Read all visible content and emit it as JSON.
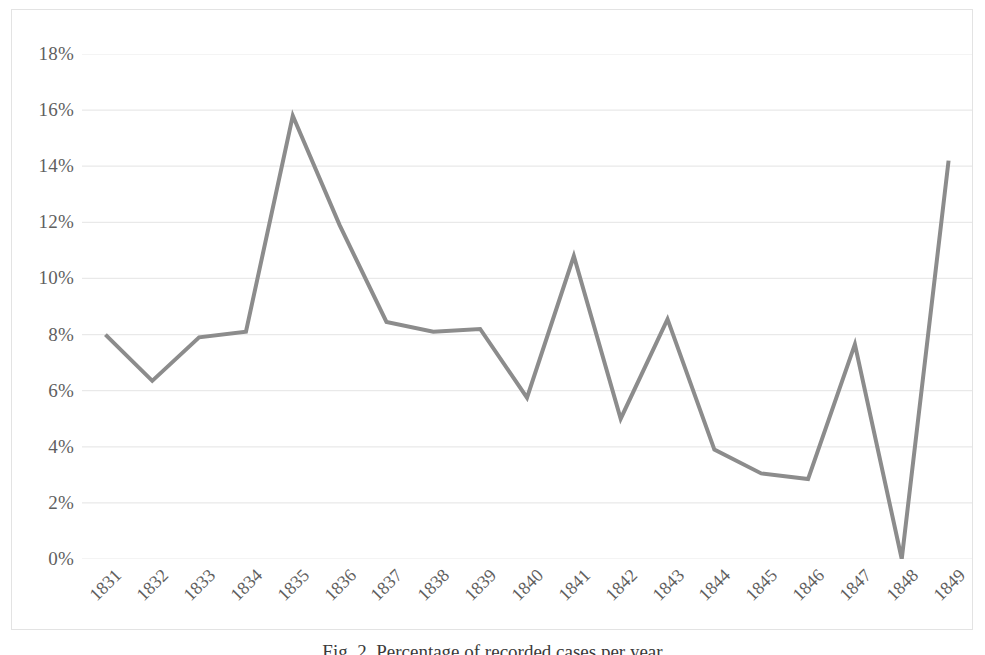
{
  "figure": {
    "caption": "Fig. 2. Percentage of recorded cases per year"
  },
  "chart_data": {
    "type": "line",
    "title": "",
    "xlabel": "",
    "ylabel": "",
    "categories": [
      "1831",
      "1832",
      "1833",
      "1834",
      "1835",
      "1836",
      "1837",
      "1838",
      "1839",
      "1840",
      "1841",
      "1842",
      "1843",
      "1844",
      "1845",
      "1846",
      "1847",
      "1848",
      "1849"
    ],
    "values": [
      8.0,
      6.35,
      7.9,
      8.1,
      15.8,
      11.9,
      8.45,
      8.1,
      8.2,
      5.75,
      10.8,
      5.0,
      8.55,
      3.9,
      3.05,
      2.85,
      7.65,
      0.0,
      14.2
    ],
    "series": [
      {
        "name": "percentage",
        "values": [
          8.0,
          6.35,
          7.9,
          8.1,
          15.8,
          11.9,
          8.45,
          8.1,
          8.2,
          5.75,
          10.8,
          5.0,
          8.55,
          3.9,
          3.05,
          2.85,
          7.65,
          0.0,
          14.2
        ]
      }
    ],
    "ylim": [
      0,
      18
    ],
    "ytick_values": [
      0,
      2,
      4,
      6,
      8,
      10,
      12,
      14,
      16,
      18
    ],
    "ytick_labels": [
      "0%",
      "2%",
      "4%",
      "6%",
      "8%",
      "10%",
      "12%",
      "14%",
      "16%",
      "18%"
    ],
    "xtick_labels": [
      "1831",
      "1832",
      "1833",
      "1834",
      "1835",
      "1836",
      "1837",
      "1838",
      "1839",
      "1840",
      "1841",
      "1842",
      "1843",
      "1844",
      "1845",
      "1846",
      "1847",
      "1848",
      "1849"
    ],
    "xtick_rotation": -45,
    "grid": {
      "horizontal": true,
      "vertical": false,
      "color": "#e9e9e9"
    },
    "legend": {
      "visible": false,
      "position": "none"
    },
    "markers": false,
    "line_color": "#8c8c8c",
    "line_width": 4,
    "plot_background": "#ffffff",
    "border_color": "#e3e3e3",
    "tick_label_color": "#5f5f5f"
  }
}
